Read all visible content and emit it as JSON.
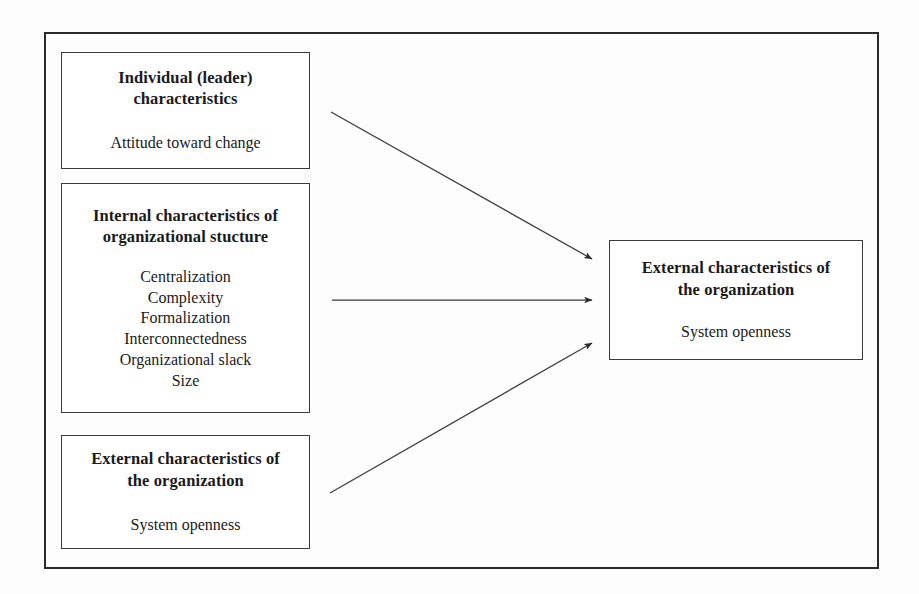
{
  "diagram": {
    "frame": {
      "border_color": "#2b2b2b"
    },
    "nodes": [
      {
        "id": "individual",
        "title": "Individual (leader)\ncharacteristics",
        "items": [
          "Attitude toward change"
        ]
      },
      {
        "id": "internal",
        "title": "Internal characteristics of\norganizational stucture",
        "items": [
          "Centralization",
          "Complexity",
          "Formalization",
          "Interconnectedness",
          "Organizational slack",
          "Size"
        ]
      },
      {
        "id": "external-left",
        "title": "External characteristics of\nthe organization",
        "items": [
          "System openness"
        ]
      },
      {
        "id": "external-right",
        "title": "External characteristics of\nthe organization",
        "items": [
          "System openness"
        ]
      }
    ],
    "arrows": [
      {
        "id": "arrow-individual-to-outcome",
        "from": "individual",
        "to": "external-right",
        "x1": 331,
        "y1": 112,
        "x2": 592,
        "y2": 259
      },
      {
        "id": "arrow-internal-to-outcome",
        "from": "internal",
        "to": "external-right",
        "x1": 332,
        "y1": 300,
        "x2": 592,
        "y2": 300
      },
      {
        "id": "arrow-externalleft-to-outcome",
        "from": "external-left",
        "to": "external-right",
        "x1": 330,
        "y1": 493,
        "x2": 592,
        "y2": 343
      }
    ],
    "colors": {
      "line": "#3a3a3a",
      "frame": "#2b2b2b",
      "box_border": "#3a3a3a",
      "text": "#1a1a1a",
      "background": "#fdfdfd"
    }
  }
}
